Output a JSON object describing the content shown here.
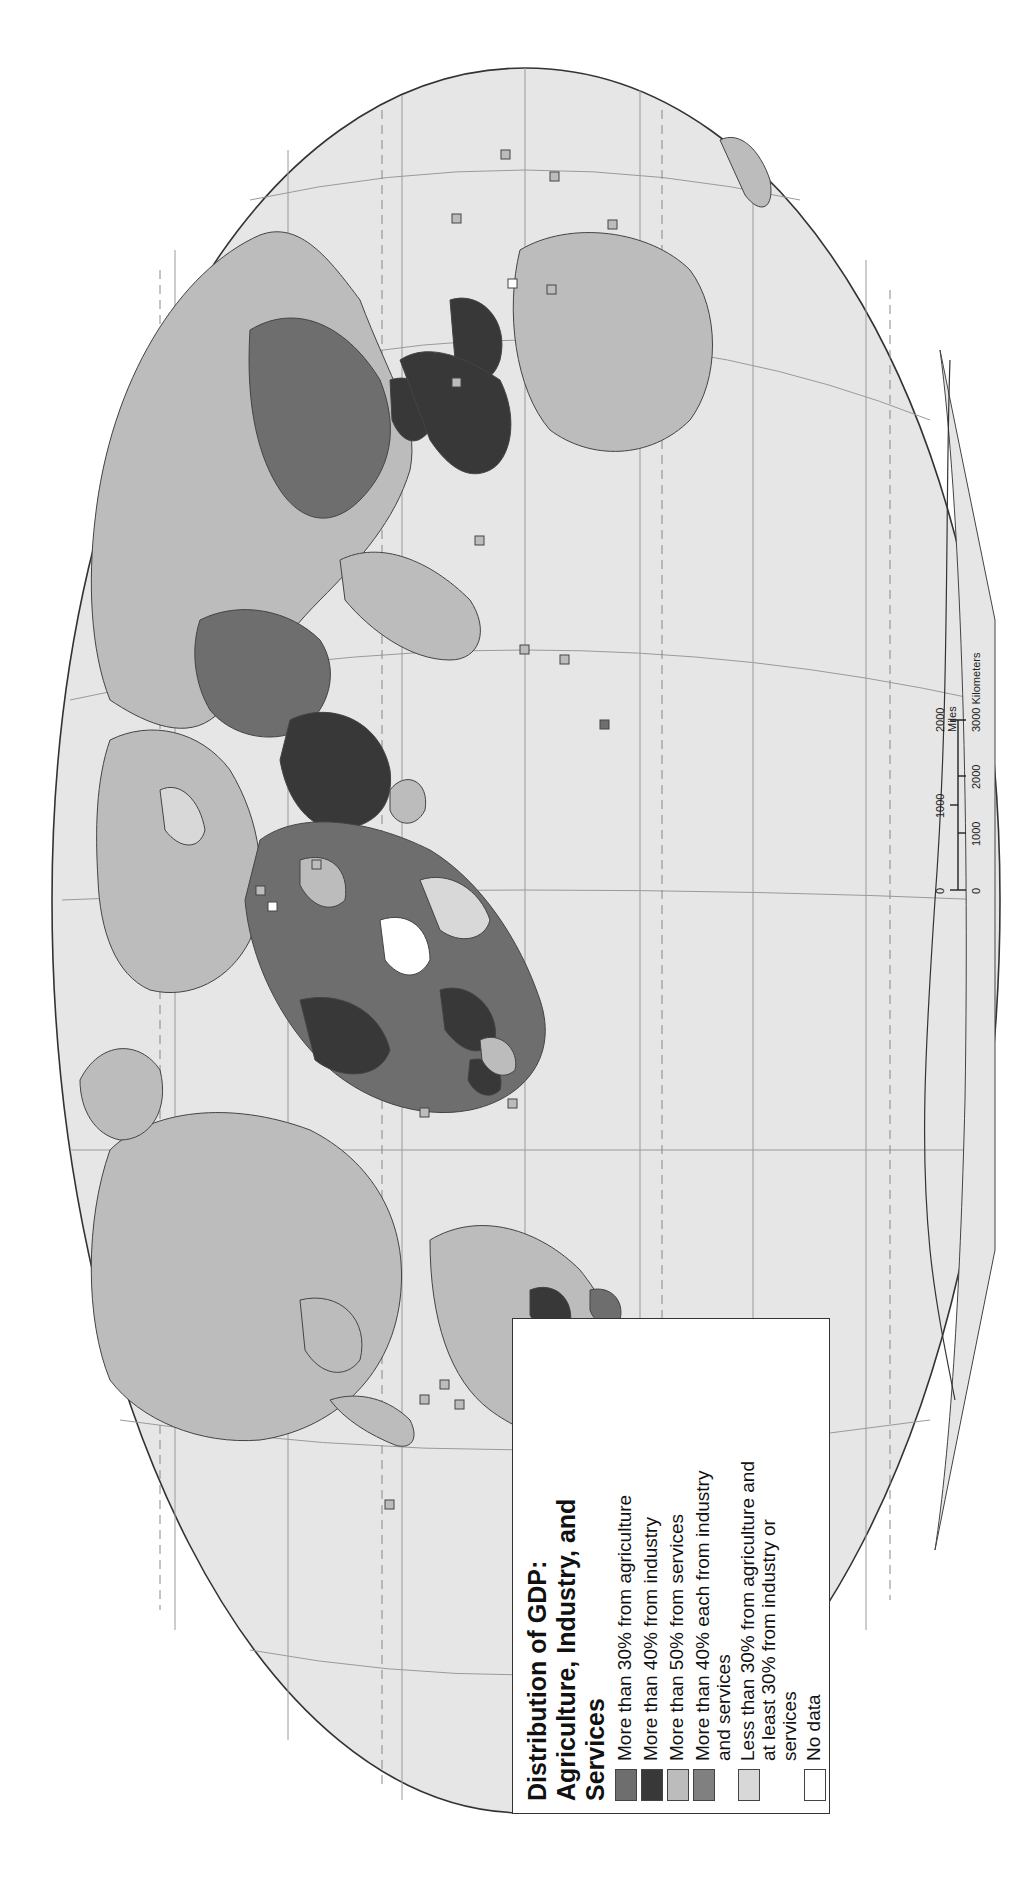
{
  "map": {
    "orientation": "rotated 90 degrees clockwise",
    "projection_shape": "elliptical world map",
    "colors": {
      "ocean": "#e6e6e6",
      "outline": "#333333",
      "graticule": "#9a9a9a",
      "agriculture": "#6e6e6e",
      "industry": "#383838",
      "services": "#bcbcbc",
      "industry_and_services": "#808080",
      "mixed": "#d8d8d8",
      "no_data": "#ffffff"
    }
  },
  "legend": {
    "title_line1": "Distribution of GDP:",
    "title_line2": "Agriculture, Industry, and",
    "title_line3": "Services",
    "items": [
      {
        "label": "More than 30% from agriculture",
        "color": "#6e6e6e"
      },
      {
        "label": "More than 40% from industry",
        "color": "#383838"
      },
      {
        "label": "More than 50% from services",
        "color": "#bcbcbc"
      },
      {
        "label": "More than 40% each from industry and services",
        "color": "#808080"
      },
      {
        "label": "Less than 30% from agriculture and at least 30% from industry or services",
        "color": "#d8d8d8"
      },
      {
        "label": "No data",
        "color": "#ffffff"
      }
    ]
  },
  "scale_bar": {
    "miles_ticks": [
      "0",
      "1000",
      "2000 Miles"
    ],
    "km_ticks": [
      "0",
      "1000",
      "2000",
      "3000 Kilometers"
    ]
  }
}
